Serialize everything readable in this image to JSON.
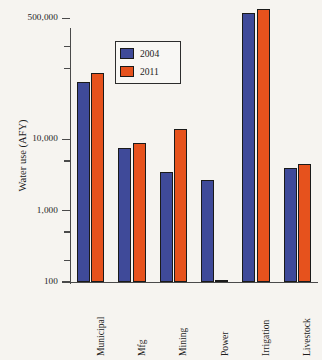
{
  "chart_data": {
    "type": "bar",
    "title": "",
    "subtitle": "",
    "xlabel": "",
    "ylabel": "Water use (AFY)",
    "scale": "log",
    "ylim": [
      100,
      700000
    ],
    "grid": false,
    "legend_position": "inside-upper-left",
    "ytick_labels": [
      "500,000",
      "10,000",
      "1,000",
      "100"
    ],
    "ytick_values": [
      500000,
      10000,
      1000,
      100
    ],
    "yminor_tick_values": [
      200000,
      100000,
      5000,
      500,
      200
    ],
    "categories": [
      "Municipal",
      "Mfg",
      "Mining",
      "Power",
      "Irrigation",
      "Livestock"
    ],
    "series": [
      {
        "name": "2004",
        "color": "#3f4a99",
        "values": [
          65000,
          7500,
          3500,
          2700,
          600000,
          4000
        ]
      },
      {
        "name": "2011",
        "color": "#e6521d",
        "values": [
          85000,
          9000,
          14000,
          105,
          680000,
          4600
        ]
      }
    ],
    "annotations": []
  },
  "legend": {
    "entries": [
      {
        "label": "2004",
        "swatch": "legend-swatch-2004"
      },
      {
        "label": "2011",
        "swatch": "legend-swatch-2011"
      }
    ]
  },
  "colors": {
    "series_2004": "#3f4a99",
    "series_2011": "#e6521d",
    "background": "#f6f4f0",
    "axis": "#4a4a4a",
    "text": "#1d1d1d"
  }
}
